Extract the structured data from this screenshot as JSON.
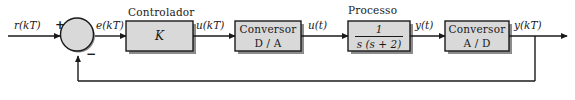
{
  "diagram": {
    "colors": {
      "block_fill": "#d9d9d9",
      "block_stroke": "#1a1a1a",
      "shadow": "#8c8c8c",
      "line": "#1a1a1a",
      "background": "#ffffff"
    },
    "summing_junction": {
      "name": "somador",
      "plus_sign": "+",
      "minus_sign": "−"
    },
    "signals": {
      "reference": "r(kT)",
      "error": "e(kT)",
      "control_discrete": "u(kT)",
      "control_continuous": "u(t)",
      "output_continuous": "y(t)",
      "output_discrete": "y(kT)"
    },
    "blocks": [
      {
        "id": "controlador",
        "caption": "Controlador",
        "body": "K",
        "line1": "K",
        "line2": ""
      },
      {
        "id": "conversor-da",
        "caption": "",
        "body": "Conversor D / A",
        "line1": "Conversor",
        "line2": "D / A"
      },
      {
        "id": "processo",
        "caption": "Processo",
        "body": "1 / (s (s + 2))",
        "line1": "1",
        "line2": "s (s + 2)"
      },
      {
        "id": "conversor-ad",
        "caption": "",
        "body": "Conversor A / D",
        "line1": "Conversor",
        "line2": "A / D"
      }
    ]
  }
}
